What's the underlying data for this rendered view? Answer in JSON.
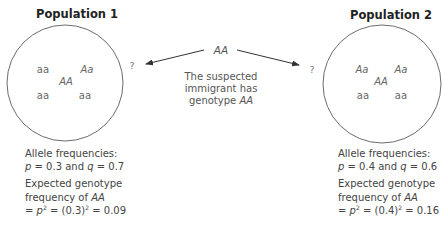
{
  "populations": [
    {
      "title": "Population 1",
      "genotypes": [
        {
          "text": "aa",
          "italic": false
        },
        {
          "text": "Aa",
          "italic": true
        },
        {
          "text": "AA",
          "italic": true
        },
        {
          "text": "aa",
          "italic": false
        },
        {
          "text": "aa",
          "italic": false
        }
      ],
      "question_mark": "?",
      "allele_header": "Allele frequencies:",
      "p_symbol": "p",
      "p_value": "0.3",
      "and_word": "and",
      "q_symbol": "q",
      "q_value": "0.7",
      "expected_line1": "Expected genotype",
      "expected_line2_prefix": "frequency of",
      "expected_genotype": "AA",
      "eq_prefix": "=",
      "p2_symbol": "p",
      "exp": "2",
      "paren_value": "(0.3)",
      "result": "0.09"
    },
    {
      "title": "Population 2",
      "genotypes": [
        {
          "text": "Aa",
          "italic": true
        },
        {
          "text": "Aa",
          "italic": true
        },
        {
          "text": "AA",
          "italic": true
        },
        {
          "text": "aa",
          "italic": false
        },
        {
          "text": "aa",
          "italic": false
        }
      ],
      "question_mark": "?",
      "allele_header": "Allele frequencies:",
      "p_symbol": "p",
      "p_value": "0.4",
      "and_word": "and",
      "q_symbol": "q",
      "q_value": "0.6",
      "expected_line1": "Expected genotype",
      "expected_line2_prefix": "frequency of",
      "expected_genotype": "AA",
      "eq_prefix": "=",
      "p2_symbol": "p",
      "exp": "2",
      "paren_value": "(0.4)",
      "result": "0.16"
    }
  ],
  "immigrant": {
    "genotype": "AA",
    "line1": "The suspected",
    "line2": "immigrant has",
    "line3_prefix": "genotype",
    "line3_genotype": "AA"
  },
  "colors": {
    "circle_stroke": "#6b6b6b",
    "arrow": "#333333",
    "text": "#444444"
  }
}
